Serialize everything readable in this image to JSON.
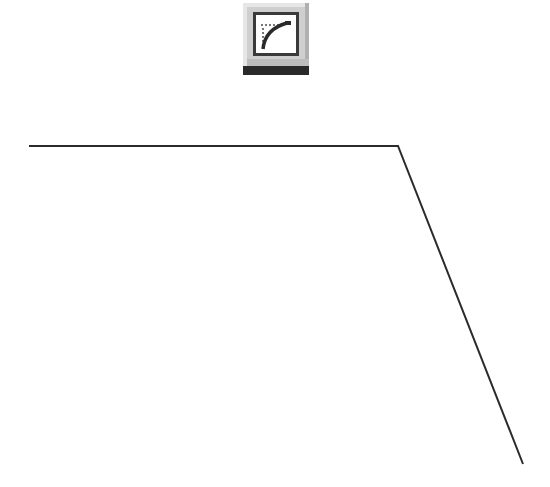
{
  "toolbar_icon": {
    "name": "curve-graph-icon",
    "colors": {
      "bevel_light": "#e2e2e2",
      "bevel_dark": "#b8b8b8",
      "frame": "#3a3a3a",
      "bar": "#2a2a2a",
      "panel": "#ffffff"
    }
  },
  "shape": {
    "type": "polyline",
    "points": [
      [
        29,
        146
      ],
      [
        398,
        146
      ],
      [
        523,
        464
      ]
    ],
    "stroke": "#2b2b2b",
    "stroke_width": 2
  }
}
